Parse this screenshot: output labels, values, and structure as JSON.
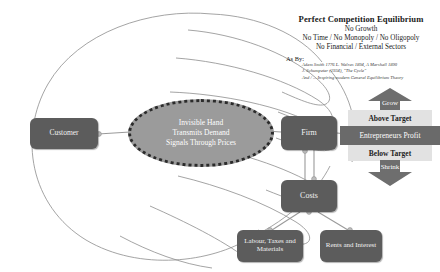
{
  "diagram": {
    "title": "Perfect Competition Equilibrium",
    "nodes": {
      "customer": "Customer",
      "firm": "Firm",
      "costs": "Costs",
      "labour": "Labour, Taxes and Materials",
      "rents": "Rents and Interest"
    },
    "ellipse": {
      "line1": "Invisible Hand",
      "line2": "Transmits Demand",
      "line3": "Signals Through Prices"
    },
    "feedback": {
      "grow": "Grow",
      "above_target": "Above Target",
      "profit": "Entrepreneurs Profit",
      "below_target": "Below Target",
      "shrink": "Shrink"
    },
    "legend": {
      "heading": "Perfect Competition Equilibrium",
      "line1": "No Growth",
      "line2": "No Time / No Monopoly / No Oligopoly",
      "line3": "No Financial / External Sectors",
      "as_by": "As By:",
      "cite1": "Adam Smith 1776    L. Walras 1894, A Marshall 1890",
      "cite2": "J. Schumpeter (1934), \"The Cycle\"",
      "cite3": "And / ... Inspiring modern General Equilibrium Theory"
    },
    "colors": {
      "node_fill": "#5c5c5c",
      "ellipse_fill": "#9b9b9b",
      "band_light": "#e2e2e2",
      "band_dark": "#6a6a6a",
      "outline": "#8a8a8a"
    }
  }
}
